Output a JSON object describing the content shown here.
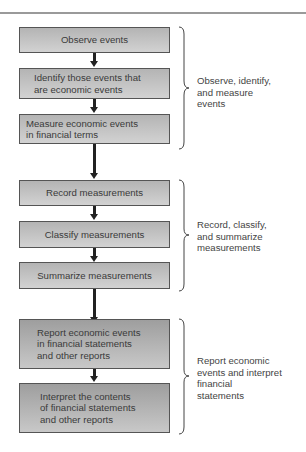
{
  "diagram": {
    "groups": [
      {
        "steps": [
          "Observe events",
          "Identify those events that are economic events",
          "Measure economic events in financial terms"
        ],
        "step_lines": [
          [
            "Observe events"
          ],
          [
            "Identify those events that",
            "are economic events"
          ],
          [
            "Measure economic events",
            "in financial terms"
          ]
        ],
        "summary_lines": [
          "Observe, identify,",
          "and measure",
          "events"
        ]
      },
      {
        "steps": [
          "Record measurements",
          "Classify measurements",
          "Summarize measurements"
        ],
        "step_lines": [
          [
            "Record measurements"
          ],
          [
            "Classify measurements"
          ],
          [
            "Summarize measurements"
          ]
        ],
        "summary_lines": [
          "Record, classify,",
          "and summarize",
          "measurements"
        ]
      },
      {
        "steps": [
          "Report economic events in financial statements and other reports",
          "Interpret the contents of financial statements and other reports"
        ],
        "step_lines": [
          [
            "Report economic events",
            "in financial statements",
            "and other reports"
          ],
          [
            "Interpret the contents",
            "of financial statements",
            "and other reports"
          ]
        ],
        "summary_lines": [
          "Report economic",
          "events and interpret",
          "financial",
          "statements"
        ]
      }
    ]
  }
}
